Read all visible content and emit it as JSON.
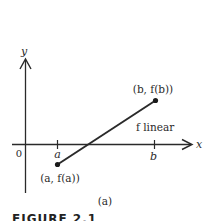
{
  "diagram": {
    "axes": {
      "x_label": "x",
      "y_label": "y",
      "origin_label": "0",
      "tick_a_label": "a",
      "tick_b_label": "b"
    },
    "points": {
      "start_label": "(a, f(a))",
      "end_label": "(b, f(b))"
    },
    "line_label": "f linear",
    "subcaption": "(a)",
    "figure_label": "FIGURE 2.1"
  },
  "colors": {
    "ink": "#2a2a2a",
    "background": "#ffffff"
  }
}
